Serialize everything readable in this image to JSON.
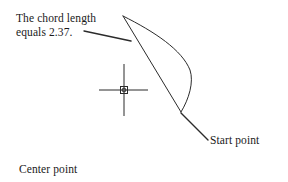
{
  "diagram": {
    "type": "technical-line-drawing",
    "canvas": {
      "width": 288,
      "height": 182,
      "background": "#ffffff"
    },
    "stroke_color": "#2b2b2b",
    "text_color": "#1a1a1a",
    "annotations": {
      "chord_length": {
        "line1": "The chord length",
        "line2": "equals 2.37.",
        "value": "2.37"
      },
      "start_point": "Start point",
      "center_point": "Center point"
    },
    "geometry": {
      "arc_apex": {
        "x": 123,
        "y": 16
      },
      "arc_end": {
        "x": 181,
        "y": 112
      },
      "arc_bulge_max": {
        "x": 190,
        "y": 70
      },
      "chord": {
        "x1": 123,
        "y1": 16,
        "x2": 181,
        "y2": 112
      },
      "center_marker": {
        "x": 124,
        "y": 90
      },
      "crosshair": {
        "vertical": {
          "x": 124,
          "y1": 64,
          "y2": 116
        },
        "horizontal": {
          "y": 90,
          "x1": 99,
          "x2": 148
        }
      },
      "leader_chord": {
        "x1": 84,
        "y1": 31,
        "x2": 131,
        "y2": 41
      },
      "leader_start": {
        "x1": 181,
        "y1": 113,
        "x2": 208,
        "y2": 140
      }
    }
  }
}
